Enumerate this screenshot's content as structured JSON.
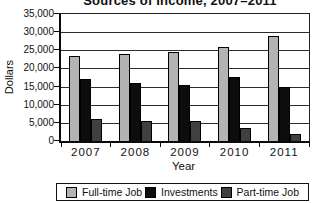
{
  "chart_data": {
    "type": "bar",
    "title": "Sources of Income, 2007–2011",
    "xlabel": "Year",
    "ylabel": "Dollars",
    "categories": [
      "2007",
      "2008",
      "2009",
      "2010",
      "2011"
    ],
    "series": [
      {
        "name": "Full-time Job",
        "color": "#b3b3b3",
        "values": [
          23500,
          24000,
          24500,
          26000,
          29000
        ]
      },
      {
        "name": "Investments",
        "color": "#0d0d0d",
        "values": [
          17000,
          16000,
          15500,
          17500,
          15000
        ]
      },
      {
        "name": "Part-time Job",
        "color": "#404040",
        "values": [
          6000,
          5500,
          5500,
          3500,
          2000
        ]
      }
    ],
    "ylim": [
      0,
      35000
    ],
    "ytick_step": 5000,
    "ytick_labels_top_down": [
      "35,000",
      "30,000",
      "25,000",
      "20,000",
      "15,000",
      "10,000",
      "5,000",
      "0"
    ],
    "grid": true,
    "legend_position": "bottom"
  }
}
